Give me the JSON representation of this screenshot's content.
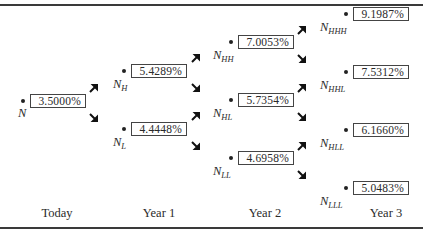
{
  "diagram": {
    "title": "",
    "type": "binomial interest rate tree"
  },
  "periods": [
    {
      "label": "Today"
    },
    {
      "label": "Year 1"
    },
    {
      "label": "Year 2"
    },
    {
      "label": "Year 3"
    }
  ],
  "nodes": {
    "N": {
      "name": "N",
      "sub": "",
      "rate": "3.5000%"
    },
    "NH": {
      "name": "N",
      "sub": "H",
      "rate": "5.4289%"
    },
    "NL": {
      "name": "N",
      "sub": "L",
      "rate": "4.4448%"
    },
    "NHH": {
      "name": "N",
      "sub": "HH",
      "rate": "7.0053%"
    },
    "NHL": {
      "name": "N",
      "sub": "HL",
      "rate": "5.7354%"
    },
    "NLL": {
      "name": "N",
      "sub": "LL",
      "rate": "4.6958%"
    },
    "NHHH": {
      "name": "N",
      "sub": "HHH",
      "rate": "9.1987%"
    },
    "NHHL": {
      "name": "N",
      "sub": "HHL",
      "rate": "7.5312%"
    },
    "NHLL": {
      "name": "N",
      "sub": "HLL",
      "rate": "6.1660%"
    },
    "NLLL": {
      "name": "N",
      "sub": "LLL",
      "rate": "5.0483%"
    }
  },
  "icons": {
    "arrow_up": "arrow-up-right-icon",
    "arrow_down": "arrow-down-right-icon"
  }
}
